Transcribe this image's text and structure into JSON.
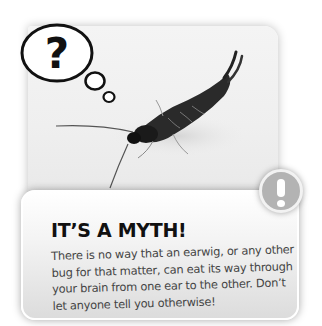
{
  "illustration": {
    "subject": "earwig photo",
    "thought_bubble_symbol": "?",
    "alert_symbol": "!"
  },
  "myth_card": {
    "title": "IT’S A MYTH!",
    "body": "There is no way that an earwig, or any other bug for that matter, can eat its way through your brain from one ear to the other. Don’t let anyone tell you otherwise!"
  },
  "colors": {
    "background": "#ffffff",
    "card_gradient_top": "#ffffff",
    "card_gradient_bottom": "#dcdcdc",
    "alert_badge": "#b3b3b3",
    "title_text": "#111111",
    "body_text": "#444444"
  }
}
